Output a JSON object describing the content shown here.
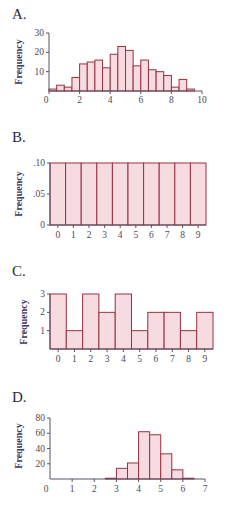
{
  "colors": {
    "bar_fill": "#f6dbe0",
    "bar_stroke": "#9b3040",
    "axis": "#555566",
    "label": "#3b3a63"
  },
  "chart_data": [
    {
      "panel": "A.",
      "type": "bar",
      "title": "",
      "xlabel": "",
      "ylabel": "Frequency",
      "bin_width": 0.5,
      "bin_edges_start": 0,
      "x": [
        0.25,
        0.75,
        1.25,
        1.75,
        2.25,
        2.75,
        3.25,
        3.75,
        4.25,
        4.75,
        5.25,
        5.75,
        6.25,
        6.75,
        7.25,
        7.75,
        8.25,
        8.75,
        9.25,
        9.75
      ],
      "values": [
        1,
        3,
        2,
        7,
        14,
        15,
        16,
        12,
        19,
        23,
        21,
        13,
        16,
        11,
        10,
        8,
        2,
        6,
        1,
        0
      ],
      "xlim": [
        0,
        10
      ],
      "ylim": [
        0,
        30
      ],
      "xticks": [
        "0",
        "2",
        "4",
        "6",
        "8",
        "10"
      ],
      "yticks": [
        "10",
        "20",
        "30"
      ],
      "grid": false
    },
    {
      "panel": "B.",
      "type": "bar",
      "title": "",
      "xlabel": "",
      "ylabel": "Frequency",
      "categories": [
        "0",
        "1",
        "2",
        "3",
        "4",
        "5",
        "6",
        "7",
        "8",
        "9"
      ],
      "values": [
        0.1,
        0.1,
        0.1,
        0.1,
        0.1,
        0.1,
        0.1,
        0.1,
        0.1,
        0.1
      ],
      "ylim": [
        0,
        0.1
      ],
      "yticks": [
        "0",
        ".05",
        ".10"
      ],
      "grid": false
    },
    {
      "panel": "C.",
      "type": "bar",
      "title": "",
      "xlabel": "",
      "ylabel": "Frequency",
      "categories": [
        "0",
        "1",
        "2",
        "3",
        "4",
        "5",
        "6",
        "7",
        "8",
        "9"
      ],
      "values": [
        3,
        1,
        3,
        2,
        3,
        1,
        2,
        2,
        1,
        2
      ],
      "ylim": [
        0,
        3
      ],
      "yticks": [
        "1",
        "2",
        "3"
      ],
      "grid": false
    },
    {
      "panel": "D.",
      "type": "bar",
      "title": "",
      "xlabel": "",
      "ylabel": "Frequency",
      "bin_width": 0.5,
      "x": [
        2.75,
        3.25,
        3.75,
        4.25,
        4.75,
        5.25,
        5.75,
        6.25
      ],
      "values": [
        1,
        14,
        21,
        62,
        58,
        33,
        12,
        1
      ],
      "xlim": [
        0,
        7
      ],
      "ylim": [
        0,
        80
      ],
      "xticks": [
        "0",
        "1",
        "2",
        "3",
        "4",
        "5",
        "6",
        "7"
      ],
      "yticks": [
        "20",
        "40",
        "60",
        "80"
      ],
      "grid": false
    }
  ]
}
